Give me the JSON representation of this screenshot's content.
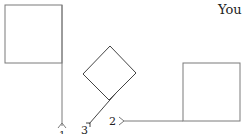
{
  "header": {
    "text": "You"
  },
  "flags": [
    {
      "id": 1,
      "label": "1",
      "orientation": "vertical-pole-down"
    },
    {
      "id": 2,
      "label": "2",
      "orientation": "horizontal-pole-left"
    },
    {
      "id": 3,
      "label": "3",
      "orientation": "diagonal-pole-down-left"
    }
  ],
  "colors": {
    "stroke": "#6b6b6b",
    "text": "#222222",
    "background": "#ffffff"
  }
}
